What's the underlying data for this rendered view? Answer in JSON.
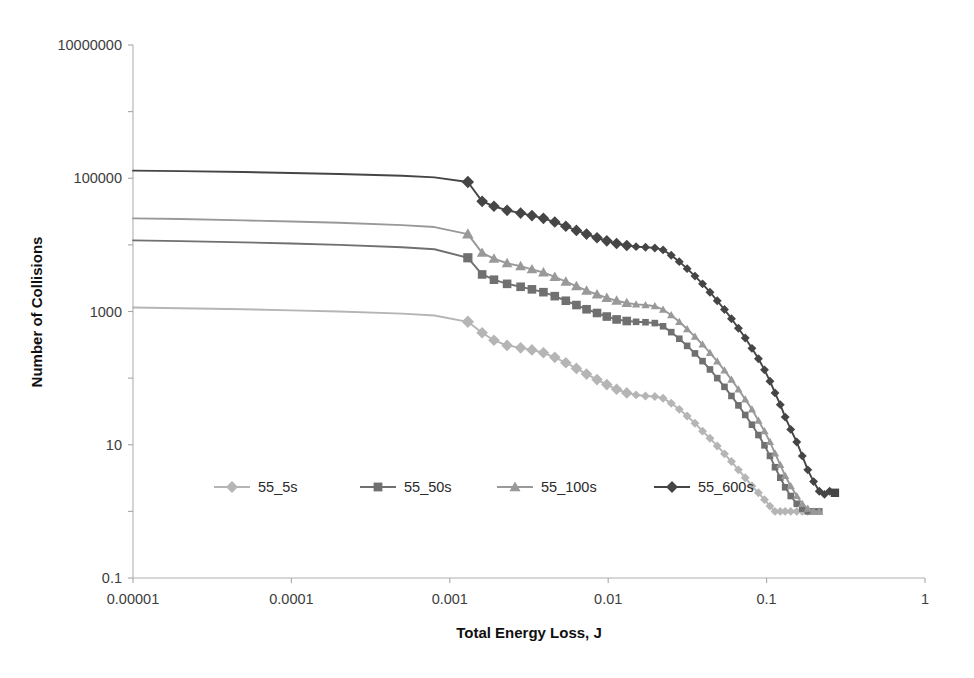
{
  "chart_data": {
    "type": "line",
    "title": "",
    "xlabel": "Total Energy Loss, J",
    "ylabel": "Number of Collisions",
    "xscale": "log",
    "yscale": "log",
    "xlim": [
      1e-05,
      1
    ],
    "ylim": [
      0.1,
      10000000
    ],
    "xticks": [
      1e-05,
      0.0001,
      0.001,
      0.01,
      0.1,
      1
    ],
    "xticklabels": [
      "0.00001",
      "0.0001",
      "0.001",
      "0.01",
      "0.1",
      "1"
    ],
    "yticks": [
      0.1,
      10,
      1000,
      100000,
      10000000
    ],
    "yticklabels": [
      "0.1",
      "10",
      "1000",
      "100000",
      "10000000"
    ],
    "grid": false,
    "legend_position": "inside-lower-left",
    "series": [
      {
        "name": "55_5s",
        "color": "#b5b5b5",
        "marker": "diamond",
        "points": [
          [
            1e-05,
            1150
          ],
          [
            2e-05,
            1120
          ],
          [
            5e-05,
            1080
          ],
          [
            0.0001,
            1040
          ],
          [
            0.0002,
            1000
          ],
          [
            0.0005,
            930
          ],
          [
            0.0008,
            870
          ],
          [
            0.0013,
            700
          ],
          [
            0.0016,
            480
          ],
          [
            0.0019,
            370
          ],
          [
            0.0023,
            310
          ],
          [
            0.0028,
            285
          ],
          [
            0.0033,
            265
          ],
          [
            0.0039,
            240
          ],
          [
            0.0046,
            205
          ],
          [
            0.0054,
            170
          ],
          [
            0.0063,
            140
          ],
          [
            0.0073,
            115
          ],
          [
            0.0085,
            95
          ],
          [
            0.0098,
            80
          ],
          [
            0.0113,
            68
          ],
          [
            0.0131,
            60
          ],
          [
            0.015,
            56
          ],
          [
            0.0172,
            54
          ],
          [
            0.0197,
            53
          ],
          [
            0.0222,
            50
          ],
          [
            0.025,
            42
          ],
          [
            0.0281,
            34
          ],
          [
            0.0315,
            27
          ],
          [
            0.0353,
            21
          ],
          [
            0.0394,
            16
          ],
          [
            0.0439,
            12.5
          ],
          [
            0.0488,
            9.6
          ],
          [
            0.0542,
            7.3
          ],
          [
            0.06,
            5.6
          ],
          [
            0.0664,
            4.2
          ],
          [
            0.0733,
            3.2
          ],
          [
            0.0808,
            2.4
          ],
          [
            0.0888,
            1.9
          ],
          [
            0.097,
            1.5
          ],
          [
            0.105,
            1.2
          ],
          [
            0.113,
            1.0
          ],
          [
            0.122,
            1.0
          ],
          [
            0.131,
            1.0
          ],
          [
            0.142,
            1.0
          ],
          [
            0.155,
            1.0
          ],
          [
            0.168,
            1.0
          ],
          [
            0.182,
            1.0
          ]
        ]
      },
      {
        "name": "55_50s",
        "color": "#707070",
        "marker": "square",
        "points": [
          [
            1e-05,
            11700
          ],
          [
            2e-05,
            11400
          ],
          [
            5e-05,
            10900
          ],
          [
            0.0001,
            10500
          ],
          [
            0.0002,
            10000
          ],
          [
            0.0005,
            9200
          ],
          [
            0.0008,
            8600
          ],
          [
            0.0013,
            6400
          ],
          [
            0.0016,
            3600
          ],
          [
            0.0019,
            3000
          ],
          [
            0.0023,
            2600
          ],
          [
            0.0028,
            2350
          ],
          [
            0.0033,
            2150
          ],
          [
            0.0039,
            1950
          ],
          [
            0.0046,
            1700
          ],
          [
            0.0054,
            1450
          ],
          [
            0.0063,
            1250
          ],
          [
            0.0073,
            1080
          ],
          [
            0.0085,
            950
          ],
          [
            0.0098,
            840
          ],
          [
            0.0113,
            760
          ],
          [
            0.0131,
            720
          ],
          [
            0.015,
            700
          ],
          [
            0.0172,
            690
          ],
          [
            0.0197,
            670
          ],
          [
            0.0222,
            600
          ],
          [
            0.025,
            490
          ],
          [
            0.0281,
            390
          ],
          [
            0.0315,
            305
          ],
          [
            0.0353,
            235
          ],
          [
            0.0394,
            180
          ],
          [
            0.0439,
            135
          ],
          [
            0.0488,
            100
          ],
          [
            0.0542,
            74
          ],
          [
            0.06,
            54
          ],
          [
            0.0664,
            39
          ],
          [
            0.0733,
            28
          ],
          [
            0.0808,
            20
          ],
          [
            0.0888,
            14
          ],
          [
            0.097,
            9.8
          ],
          [
            0.105,
            6.8
          ],
          [
            0.113,
            4.6
          ],
          [
            0.122,
            3.2
          ],
          [
            0.131,
            2.3
          ],
          [
            0.142,
            1.7
          ],
          [
            0.155,
            1.3
          ],
          [
            0.168,
            1.1
          ],
          [
            0.182,
            1.0
          ],
          [
            0.198,
            1.0
          ],
          [
            0.215,
            1.0
          ]
        ]
      },
      {
        "name": "55_100s",
        "color": "#999999",
        "marker": "triangle",
        "points": [
          [
            1e-05,
            25000
          ],
          [
            2e-05,
            24400
          ],
          [
            5e-05,
            23300
          ],
          [
            0.0001,
            22400
          ],
          [
            0.0002,
            21500
          ],
          [
            0.0005,
            19800
          ],
          [
            0.0008,
            18500
          ],
          [
            0.0013,
            14500
          ],
          [
            0.0016,
            7600
          ],
          [
            0.0019,
            6200
          ],
          [
            0.0023,
            5300
          ],
          [
            0.0028,
            4800
          ],
          [
            0.0033,
            4300
          ],
          [
            0.0039,
            3850
          ],
          [
            0.0046,
            3300
          ],
          [
            0.0054,
            2800
          ],
          [
            0.0063,
            2400
          ],
          [
            0.0073,
            2050
          ],
          [
            0.0085,
            1800
          ],
          [
            0.0098,
            1600
          ],
          [
            0.0113,
            1450
          ],
          [
            0.0131,
            1340
          ],
          [
            0.015,
            1280
          ],
          [
            0.0172,
            1250
          ],
          [
            0.0197,
            1200
          ],
          [
            0.0222,
            1070
          ],
          [
            0.025,
            880
          ],
          [
            0.0281,
            700
          ],
          [
            0.0315,
            545
          ],
          [
            0.0353,
            420
          ],
          [
            0.0394,
            320
          ],
          [
            0.0439,
            240
          ],
          [
            0.0488,
            178
          ],
          [
            0.0542,
            131
          ],
          [
            0.06,
            95
          ],
          [
            0.0664,
            68
          ],
          [
            0.0733,
            48
          ],
          [
            0.0808,
            34
          ],
          [
            0.0888,
            23
          ],
          [
            0.097,
            16
          ],
          [
            0.105,
            11
          ],
          [
            0.113,
            7.4
          ],
          [
            0.122,
            5.0
          ],
          [
            0.131,
            3.4
          ],
          [
            0.142,
            2.4
          ],
          [
            0.155,
            1.7
          ],
          [
            0.168,
            1.3
          ],
          [
            0.182,
            1.1
          ],
          [
            0.198,
            1.0
          ],
          [
            0.215,
            1.0
          ]
        ]
      },
      {
        "name": "55_600s",
        "color": "#454545",
        "marker": "diamond",
        "points": [
          [
            1e-05,
            130000
          ],
          [
            2e-05,
            128000
          ],
          [
            5e-05,
            124000
          ],
          [
            0.0001,
            120000
          ],
          [
            0.0002,
            116000
          ],
          [
            0.0005,
            109000
          ],
          [
            0.0008,
            103000
          ],
          [
            0.0013,
            88000
          ],
          [
            0.0016,
            45000
          ],
          [
            0.0019,
            38000
          ],
          [
            0.0023,
            33000
          ],
          [
            0.0028,
            30000
          ],
          [
            0.0033,
            27500
          ],
          [
            0.0039,
            25000
          ],
          [
            0.0046,
            22000
          ],
          [
            0.0054,
            19000
          ],
          [
            0.0063,
            16500
          ],
          [
            0.0073,
            14500
          ],
          [
            0.0085,
            12800
          ],
          [
            0.0098,
            11500
          ],
          [
            0.0113,
            10500
          ],
          [
            0.0131,
            9800
          ],
          [
            0.015,
            9400
          ],
          [
            0.0172,
            9200
          ],
          [
            0.0197,
            9000
          ],
          [
            0.0222,
            8400
          ],
          [
            0.025,
            7000
          ],
          [
            0.0281,
            5600
          ],
          [
            0.0315,
            4400
          ],
          [
            0.0353,
            3400
          ],
          [
            0.0394,
            2600
          ],
          [
            0.0439,
            1950
          ],
          [
            0.0488,
            1450
          ],
          [
            0.0542,
            1070
          ],
          [
            0.06,
            780
          ],
          [
            0.0664,
            560
          ],
          [
            0.0733,
            400
          ],
          [
            0.0808,
            280
          ],
          [
            0.0888,
            195
          ],
          [
            0.097,
            133
          ],
          [
            0.105,
            90
          ],
          [
            0.113,
            60
          ],
          [
            0.122,
            40
          ],
          [
            0.131,
            26
          ],
          [
            0.142,
            17
          ],
          [
            0.155,
            11
          ],
          [
            0.168,
            6.8
          ],
          [
            0.182,
            4.2
          ],
          [
            0.198,
            2.8
          ],
          [
            0.215,
            2.0
          ],
          [
            0.232,
            1.8
          ],
          [
            0.25,
            2.0
          ]
        ],
        "outlier_points": [
          [
            0.27,
            1.9
          ]
        ]
      }
    ]
  },
  "legend": {
    "items": [
      {
        "label": "55_5s"
      },
      {
        "label": "55_50s"
      },
      {
        "label": "55_100s"
      },
      {
        "label": "55_600s"
      }
    ]
  },
  "axes": {
    "x_title": "Total Energy Loss, J",
    "y_title": "Number of Collisions"
  }
}
